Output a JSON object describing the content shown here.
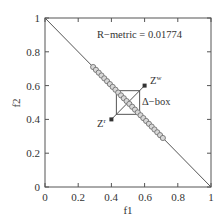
{
  "chart_data": {
    "type": "scatter",
    "title": "",
    "xlabel": "f1",
    "ylabel": "f2",
    "xlim": [
      0,
      1
    ],
    "ylim": [
      0,
      1
    ],
    "x_ticks": [
      "0",
      "0.2",
      "0.4",
      "0.6",
      "0.8",
      "1"
    ],
    "y_ticks": [
      "0",
      "0.2",
      "0.4",
      "0.6",
      "0.8",
      "1"
    ],
    "grid": false,
    "annotations": {
      "r_metric": "R−metric = 0.01774",
      "zw_label": "Z",
      "zw_sup": "w",
      "zr_label": "Z",
      "zr_sup": "r",
      "delta_box": "Δ−box"
    },
    "series": [
      {
        "name": "Pareto front",
        "type": "line",
        "points": [
          [
            0,
            1
          ],
          [
            1,
            0
          ]
        ]
      },
      {
        "name": "Solutions",
        "type": "scatter",
        "marker": "circle",
        "x_range": [
          0.29,
          0.71
        ],
        "count": 26
      },
      {
        "name": "Reference points",
        "type": "scatter",
        "marker": "square",
        "points": [
          {
            "label": "Z^w",
            "x": 0.6,
            "y": 0.6
          },
          {
            "label": "Z^r",
            "x": 0.4,
            "y": 0.4
          }
        ]
      }
    ],
    "delta_box": {
      "x": [
        0.43,
        0.57
      ],
      "y": [
        0.43,
        0.57
      ]
    }
  }
}
